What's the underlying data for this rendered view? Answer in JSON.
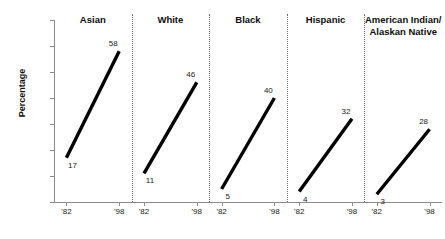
{
  "chart_data": {
    "type": "line",
    "title": "",
    "subtitle": "",
    "xlabel": "",
    "ylabel": "Percentage",
    "ylim": [
      0,
      70
    ],
    "ytick_values": [
      0,
      10,
      20,
      30,
      40,
      50,
      60,
      70
    ],
    "ytick_labels": [
      "0",
      "10",
      "20",
      "30",
      "40",
      "50",
      "60",
      "70"
    ],
    "x": [
      "'82",
      "'98"
    ],
    "xtick_labels": [
      "'82",
      "'98"
    ],
    "grid": false,
    "legend": "none",
    "panel_layout": "small-multiples-horizontal",
    "panels": [
      {
        "name": "Asian",
        "label": "Asian",
        "values": [
          17,
          58
        ],
        "point_labels": [
          "17",
          "58"
        ]
      },
      {
        "name": "White",
        "label": "White",
        "values": [
          11,
          46
        ],
        "point_labels": [
          "11",
          "46"
        ]
      },
      {
        "name": "Black",
        "label": "Black",
        "values": [
          5,
          40
        ],
        "point_labels": [
          "5",
          "40"
        ]
      },
      {
        "name": "Hispanic",
        "label": "Hispanic",
        "values": [
          4,
          32
        ],
        "point_labels": [
          "4",
          "32"
        ]
      },
      {
        "name": "American Indian/Alaskan Native",
        "label": "American Indian/\nAlaskan Native",
        "values": [
          3,
          28
        ],
        "point_labels": [
          "3",
          "28"
        ]
      }
    ],
    "series": [
      {
        "name": "Percentage by race/ethnicity",
        "categories": [
          "Asian",
          "White",
          "Black",
          "Hispanic",
          "American Indian/Alaskan Native"
        ],
        "start_year": "'82",
        "end_year": "'98",
        "start_values": [
          17,
          11,
          5,
          4,
          3
        ],
        "end_values": [
          58,
          46,
          40,
          32,
          28
        ]
      }
    ],
    "colors": {
      "line": "#000000",
      "axis": "#8a8a8a",
      "divider": "#6e6e6e",
      "text": "#1a1a1a",
      "background": "#ffffff"
    }
  }
}
